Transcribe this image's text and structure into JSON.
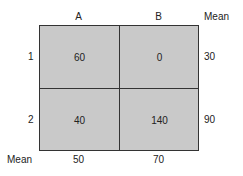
{
  "table": {
    "column_headers": [
      "A",
      "B",
      "Mean"
    ],
    "rows": [
      {
        "label": "1",
        "cells": [
          "60",
          "0"
        ],
        "mean": "30"
      },
      {
        "label": "2",
        "cells": [
          "40",
          "140"
        ],
        "mean": "90"
      }
    ],
    "mean_row": {
      "label": "Mean",
      "values": [
        "50",
        "70"
      ]
    }
  },
  "colors": {
    "cell_fill": "#c9c9c9",
    "border": "#333333"
  }
}
